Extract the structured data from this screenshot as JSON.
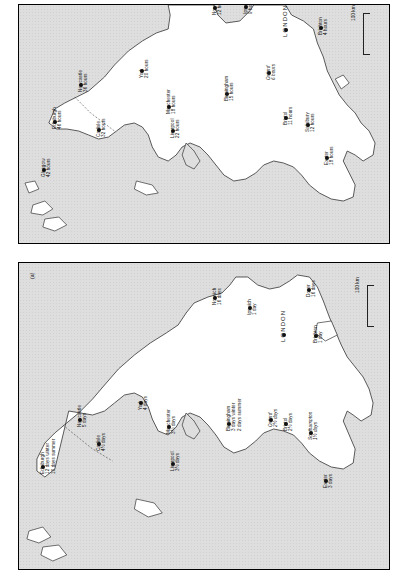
{
  "figure": {
    "orientation": "rotated-90-ccw",
    "panels": [
      {
        "id": "panel-top",
        "tag": "",
        "unit_label": "hours",
        "scale": {
          "label": "100 km"
        },
        "cities": [
          {
            "name": "Edinburgh",
            "value": "46 hours",
            "x": 52,
            "y": 119
          },
          {
            "name": "Glasgow",
            "value": "42 hours",
            "x": 41,
            "y": 167
          },
          {
            "name": "Newcastle",
            "value": "36 hours",
            "x": 78,
            "y": 82
          },
          {
            "name": "Carlisle",
            "value": "32 hours",
            "x": 96,
            "y": 127
          },
          {
            "name": "York",
            "value": "20 hours",
            "x": 139,
            "y": 68
          },
          {
            "name": "Manchester",
            "value": "18 hours",
            "x": 166,
            "y": 104
          },
          {
            "name": "Liverpool",
            "value": "22 hours",
            "x": 170,
            "y": 128
          },
          {
            "name": "Birmingham",
            "value": "15 hours",
            "x": 224,
            "y": 91
          },
          {
            "name": "Norwich",
            "value": "12 hours",
            "x": 212,
            "y": 5
          },
          {
            "name": "Ipswich",
            "value": "9 hours",
            "x": 243,
            "y": 4
          },
          {
            "name": "Oxford",
            "value": "6 hours",
            "x": 266,
            "y": 70
          },
          {
            "name": "LONDON",
            "value": "",
            "x": 283,
            "y": 27
          },
          {
            "name": "Bristol",
            "value": "11 hours",
            "x": 283,
            "y": 115
          },
          {
            "name": "Brighton",
            "value": "4 hours",
            "x": 318,
            "y": 25
          },
          {
            "name": "Salisbury",
            "value": "12 hours",
            "x": 305,
            "y": 122
          },
          {
            "name": "Exeter",
            "value": "18 hours",
            "x": 324,
            "y": 155
          }
        ]
      },
      {
        "id": "panel-bottom",
        "tag": "(a)",
        "unit_label": "days",
        "scale": {
          "label": "100 km"
        },
        "cities": [
          {
            "name": "Edinburgh",
            "value": "12 days winter\n10 days summer",
            "x": 40,
            "y": 464
          },
          {
            "name": "Newcastle",
            "value": "5 days",
            "x": 77,
            "y": 417
          },
          {
            "name": "Carlisle",
            "value": "4½ days",
            "x": 96,
            "y": 441
          },
          {
            "name": "York",
            "value": "4 days",
            "x": 138,
            "y": 400
          },
          {
            "name": "Manchester",
            "value": "3½ days",
            "x": 166,
            "y": 424
          },
          {
            "name": "Liverpool",
            "value": "3½ days",
            "x": 170,
            "y": 461
          },
          {
            "name": "Birmingham",
            "value": "3 days winter\n2 days summer",
            "x": 226,
            "y": 421
          },
          {
            "name": "Norwich",
            "value": "16 days",
            "x": 212,
            "y": 295
          },
          {
            "name": "Ipswich",
            "value": "1 day",
            "x": 247,
            "y": 305
          },
          {
            "name": "Dover",
            "value": "16 days",
            "x": 306,
            "y": 287
          },
          {
            "name": "Oxford",
            "value": "2½ days",
            "x": 268,
            "y": 417
          },
          {
            "name": "LONDON",
            "value": "",
            "x": 281,
            "y": 332
          },
          {
            "name": "Bristol",
            "value": "2½ days",
            "x": 283,
            "y": 421
          },
          {
            "name": "Brighton",
            "value": "1 day",
            "x": 313,
            "y": 333
          },
          {
            "name": "Southampton",
            "value": "1½ days",
            "x": 308,
            "y": 430
          },
          {
            "name": "Exeter",
            "value": "3 days",
            "x": 323,
            "y": 478
          }
        ]
      }
    ]
  }
}
